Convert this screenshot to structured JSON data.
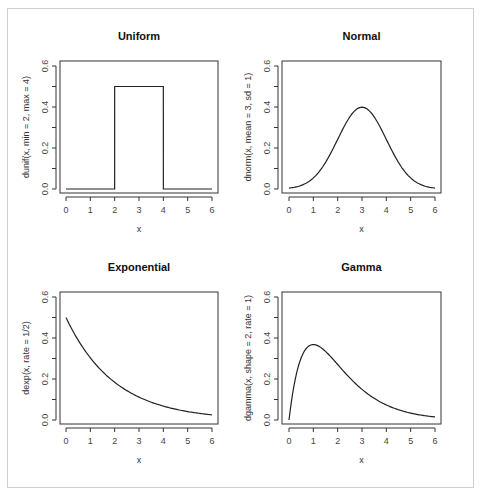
{
  "chart_data": [
    {
      "type": "line",
      "title": "Uniform",
      "xlabel": "x",
      "ylabel": "dunif(x, min = 2, max = 4)",
      "xlim": [
        0,
        6
      ],
      "ylim": [
        0,
        0.6
      ],
      "xticks": [
        0,
        1,
        2,
        3,
        4,
        5,
        6
      ],
      "yticks": [
        "0.0",
        "0.2",
        "0.4",
        "0.6"
      ],
      "grid": false,
      "legend": null,
      "distribution": {
        "name": "unif",
        "min": 2,
        "max": 4
      },
      "x": [
        0,
        1,
        1.999,
        2,
        3,
        4,
        4.001,
        5,
        6
      ],
      "y": [
        0,
        0,
        0,
        0.5,
        0.5,
        0.5,
        0,
        0,
        0
      ]
    },
    {
      "type": "line",
      "title": "Normal",
      "xlabel": "x",
      "ylabel": "dnorm(x, mean = 3, sd = 1)",
      "xlim": [
        0,
        6
      ],
      "ylim": [
        0,
        0.6
      ],
      "xticks": [
        0,
        1,
        2,
        3,
        4,
        5,
        6
      ],
      "yticks": [
        "0.0",
        "0.2",
        "0.4",
        "0.6"
      ],
      "grid": false,
      "legend": null,
      "distribution": {
        "name": "norm",
        "mean": 3,
        "sd": 1
      },
      "x": [
        0,
        0.5,
        1,
        1.5,
        2,
        2.5,
        3,
        3.5,
        4,
        4.5,
        5,
        5.5,
        6
      ],
      "y": [
        0.004,
        0.018,
        0.054,
        0.13,
        0.242,
        0.352,
        0.399,
        0.352,
        0.242,
        0.13,
        0.054,
        0.018,
        0.004
      ]
    },
    {
      "type": "line",
      "title": "Exponential",
      "xlabel": "x",
      "ylabel": "dexp(x, rate = 1/2)",
      "xlim": [
        0,
        6
      ],
      "ylim": [
        0,
        0.6
      ],
      "xticks": [
        0,
        1,
        2,
        3,
        4,
        5,
        6
      ],
      "yticks": [
        "0.0",
        "0.2",
        "0.4",
        "0.6"
      ],
      "grid": false,
      "legend": null,
      "distribution": {
        "name": "exp",
        "rate": 0.5
      },
      "x": [
        0,
        0.5,
        1,
        1.5,
        2,
        2.5,
        3,
        3.5,
        4,
        4.5,
        5,
        5.5,
        6
      ],
      "y": [
        0.5,
        0.389,
        0.303,
        0.236,
        0.184,
        0.143,
        0.112,
        0.087,
        0.068,
        0.053,
        0.041,
        0.032,
        0.025
      ]
    },
    {
      "type": "line",
      "title": "Gamma",
      "xlabel": "x",
      "ylabel": "dgamma(x, shape = 2, rate = 1)",
      "xlim": [
        0,
        6
      ],
      "ylim": [
        0,
        0.6
      ],
      "xticks": [
        0,
        1,
        2,
        3,
        4,
        5,
        6
      ],
      "yticks": [
        "0.0",
        "0.2",
        "0.4",
        "0.6"
      ],
      "grid": false,
      "legend": null,
      "distribution": {
        "name": "gamma",
        "shape": 2,
        "rate": 1
      },
      "x": [
        0,
        0.25,
        0.5,
        0.75,
        1,
        1.5,
        2,
        2.5,
        3,
        3.5,
        4,
        4.5,
        5,
        5.5,
        6
      ],
      "y": [
        0,
        0.195,
        0.303,
        0.354,
        0.368,
        0.335,
        0.271,
        0.205,
        0.149,
        0.106,
        0.073,
        0.05,
        0.034,
        0.022,
        0.015
      ]
    }
  ],
  "layout": {
    "panels": [
      {
        "box": [
          60,
          61,
          218,
          193
        ],
        "x0px": 66,
        "x6px": 212,
        "y0px": 189,
        "y06px": 66,
        "title_y": 40,
        "xlabel_y": 232
      },
      {
        "box": [
          282,
          61,
          441,
          193
        ],
        "x0px": 289,
        "x6px": 435,
        "y0px": 189,
        "y06px": 66,
        "title_y": 40,
        "xlabel_y": 232
      },
      {
        "box": [
          60,
          292,
          218,
          424
        ],
        "x0px": 66,
        "x6px": 212,
        "y0px": 420,
        "y06px": 297,
        "title_y": 271,
        "xlabel_y": 463
      },
      {
        "box": [
          282,
          292,
          441,
          424
        ],
        "x0px": 289,
        "x6px": 435,
        "y0px": 420,
        "y06px": 297,
        "title_y": 271,
        "xlabel_y": 463
      }
    ],
    "line_color": "#222222",
    "axis_color": "#333333"
  }
}
